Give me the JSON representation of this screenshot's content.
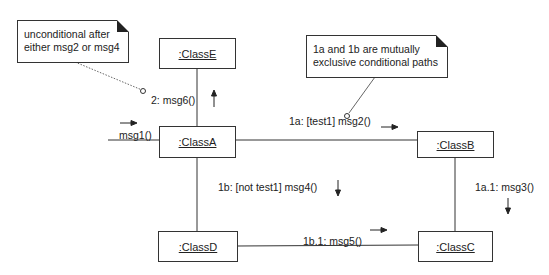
{
  "diagram": {
    "type": "uml-communication",
    "objects": [
      {
        "id": "E",
        "label": ":ClassE"
      },
      {
        "id": "A",
        "label": ":ClassA"
      },
      {
        "id": "B",
        "label": ":ClassB"
      },
      {
        "id": "D",
        "label": ":ClassD"
      },
      {
        "id": "C",
        "label": ":ClassC"
      }
    ],
    "messages": {
      "m1": "msg1()",
      "m6": "2: msg6()",
      "m2": "1a: [test1]  msg2()",
      "m4": "1b: [not test1] msg4()",
      "m3": "1a.1: msg3()",
      "m5": "1b.1: msg5()"
    },
    "notes": {
      "n1": "unconditional after\neither msg2 or msg4",
      "n2": "1a and 1b are mutually\nexclusive conditional paths"
    },
    "colors": {
      "line": "#333333",
      "background": "#ffffff",
      "text": "#222222"
    }
  }
}
